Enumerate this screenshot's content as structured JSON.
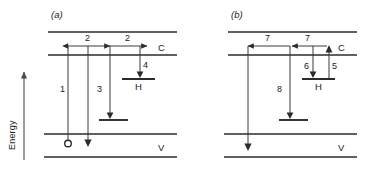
{
  "figure": {
    "axis": {
      "label": "Energy",
      "arrow_direction": "up",
      "icon": "up-arrow-icon"
    },
    "panels": [
      {
        "id": "a",
        "label": "(a)",
        "bands": [
          {
            "name": "top-band",
            "label": ""
          },
          {
            "name": "conduction-band",
            "label": "C"
          },
          {
            "name": "valence-band",
            "label": "V"
          },
          {
            "name": "bottom-band",
            "label": ""
          }
        ],
        "sublevel_label": "H",
        "transitions": [
          {
            "id": "1",
            "label": "1",
            "kind": "vertical",
            "direction": "up"
          },
          {
            "id": "2a",
            "label": "2",
            "kind": "horizontal",
            "direction": "right"
          },
          {
            "id": "2b",
            "label": "2",
            "kind": "horizontal",
            "direction": "right"
          },
          {
            "id": "3",
            "label": "3",
            "kind": "vertical",
            "direction": "down"
          },
          {
            "id": "4",
            "label": "4",
            "kind": "vertical",
            "direction": "down"
          }
        ],
        "marker": {
          "name": "hole-marker",
          "shape": "circle"
        }
      },
      {
        "id": "b",
        "label": "(b)",
        "bands": [
          {
            "name": "top-band",
            "label": ""
          },
          {
            "name": "conduction-band",
            "label": "C"
          },
          {
            "name": "valence-band",
            "label": "V"
          },
          {
            "name": "bottom-band",
            "label": ""
          }
        ],
        "sublevel_label": "H",
        "transitions": [
          {
            "id": "7a",
            "label": "7",
            "kind": "horizontal",
            "direction": "left"
          },
          {
            "id": "7b",
            "label": "7",
            "kind": "horizontal",
            "direction": "left"
          },
          {
            "id": "8",
            "label": "8",
            "kind": "vertical",
            "direction": "down"
          },
          {
            "id": "6",
            "label": "6",
            "kind": "vertical",
            "direction": "down"
          },
          {
            "id": "5",
            "label": "5",
            "kind": "vertical",
            "direction": "up"
          }
        ]
      }
    ]
  }
}
